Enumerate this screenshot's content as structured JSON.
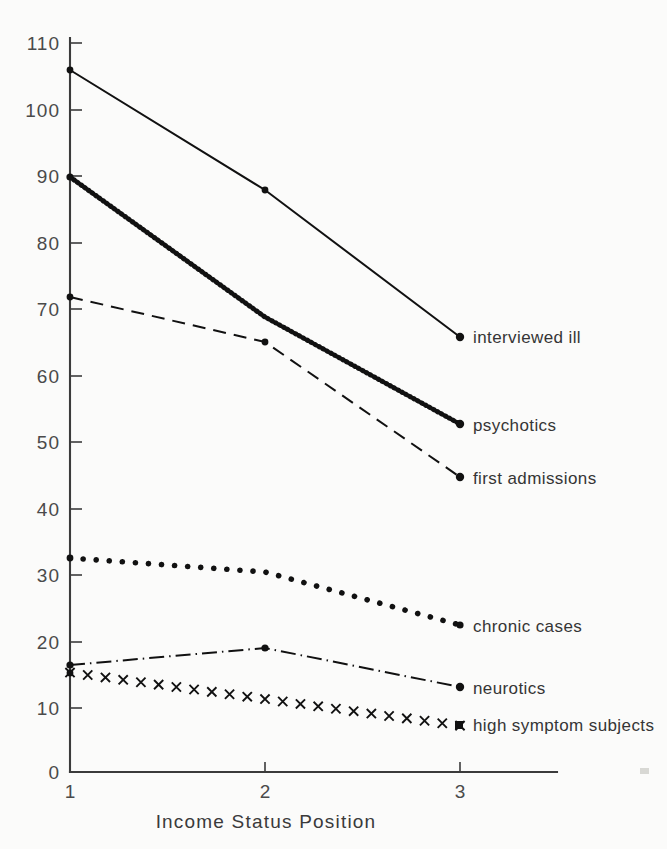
{
  "chart_data": {
    "type": "line",
    "title": "",
    "xlabel": "Income Status Position",
    "ylabel": "",
    "categories": [
      "1",
      "2",
      "3"
    ],
    "x": [
      1,
      2,
      3
    ],
    "xlim": [
      1,
      3
    ],
    "ylim": [
      0,
      110
    ],
    "grid": false,
    "legend_position": "right-inline-labels",
    "xticks": [
      "1",
      "2",
      "3"
    ],
    "yticks": [
      "0",
      "10",
      "20",
      "30",
      "40",
      "50",
      "60",
      "70",
      "80",
      "90",
      "100",
      "110"
    ],
    "series": [
      {
        "name": "interviewed ill",
        "values": [
          105,
          87,
          65
        ],
        "style": "solid",
        "marker": "dot"
      },
      {
        "name": "psychotics",
        "values": [
          89,
          68,
          52
        ],
        "style": "zigzag",
        "marker": "dot"
      },
      {
        "name": "first admissions",
        "values": [
          71,
          65,
          44
        ],
        "style": "dashed",
        "marker": "dot"
      },
      {
        "name": "chronic cases",
        "values": [
          32,
          30,
          22
        ],
        "style": "dotted",
        "marker": "dot"
      },
      {
        "name": "neurotics",
        "values": [
          16,
          19,
          13
        ],
        "style": "dashdot",
        "marker": "dot"
      },
      {
        "name": "high symptom subjects",
        "values": [
          15,
          11,
          7
        ],
        "style": "x-markers",
        "marker": "x"
      }
    ]
  },
  "axis": {
    "x_title": "Income Status Position",
    "y_tick_110": "110",
    "y_tick_100": "100",
    "y_tick_90": "90",
    "y_tick_80": "80",
    "y_tick_70": "70",
    "y_tick_60": "60",
    "y_tick_50": "50",
    "y_tick_40": "40",
    "y_tick_30": "30",
    "y_tick_20": "20",
    "y_tick_10": "10",
    "y_tick_0": "0",
    "x_tick_1": "1",
    "x_tick_2": "2",
    "x_tick_3": "3"
  },
  "labels": {
    "interviewed_ill": "interviewed ill",
    "psychotics": "psychotics",
    "first_admissions": "first admissions",
    "chronic_cases": "chronic cases",
    "neurotics": "neurotics",
    "high_symptom_subjects": "high symptom subjects"
  },
  "colors": {
    "ink": "#111111",
    "axis": "#3b3b3b",
    "label_text": "#353535",
    "tick_text": "#4a4a4a",
    "background": "#fbfbfa"
  }
}
